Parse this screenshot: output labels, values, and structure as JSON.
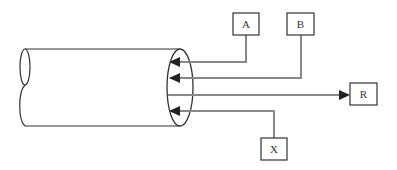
{
  "diagram": {
    "type": "pipe-flow-diagram",
    "nodes": [
      {
        "id": "A",
        "label": "A",
        "direction": "input"
      },
      {
        "id": "B",
        "label": "B",
        "direction": "input"
      },
      {
        "id": "R",
        "label": "R",
        "direction": "output"
      },
      {
        "id": "X",
        "label": "X",
        "direction": "input"
      }
    ],
    "edges": [
      {
        "from": "A",
        "to": "pipe"
      },
      {
        "from": "B",
        "to": "pipe"
      },
      {
        "from": "pipe",
        "to": "R"
      },
      {
        "from": "X",
        "to": "pipe"
      }
    ]
  },
  "labels": {
    "a": "A",
    "b": "B",
    "r": "R",
    "x": "X"
  }
}
